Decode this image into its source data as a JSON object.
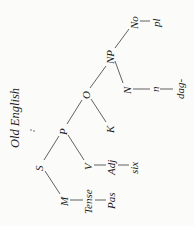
{
  "title": "Old English",
  "orientation": "rotated -90deg (tree reads left-to-right when page turned clockwise)",
  "tree": {
    "nodes": {
      "S": {
        "label": "S"
      },
      "P": {
        "label": "P"
      },
      "O": {
        "label": "O"
      },
      "NP": {
        "label": "NP"
      },
      "No": {
        "label": "No"
      },
      "pl": {
        "label": "pl"
      },
      "N": {
        "label": "N"
      },
      "n": {
        "label": "n"
      },
      "dag": {
        "label": "dag-"
      },
      "K": {
        "label": "K"
      },
      "V": {
        "label": "V"
      },
      "Adj": {
        "label": "Adj"
      },
      "six": {
        "label": "six"
      },
      "M": {
        "label": "M"
      },
      "Tense": {
        "label": "Tense"
      },
      "Pas": {
        "label": "Pas"
      }
    },
    "branches": [
      [
        "S",
        "P"
      ],
      [
        "S",
        "M"
      ],
      [
        "P",
        "O"
      ],
      [
        "P",
        "V"
      ],
      [
        "O",
        "NP"
      ],
      [
        "O",
        "K"
      ],
      [
        "NP",
        "No"
      ],
      [
        "NP",
        "N"
      ]
    ],
    "chains": [
      [
        "No",
        "pl"
      ],
      [
        "N",
        "n",
        "dag"
      ],
      [
        "V",
        "Adj",
        "six"
      ],
      [
        "M",
        "Tense",
        "Pas"
      ]
    ]
  }
}
